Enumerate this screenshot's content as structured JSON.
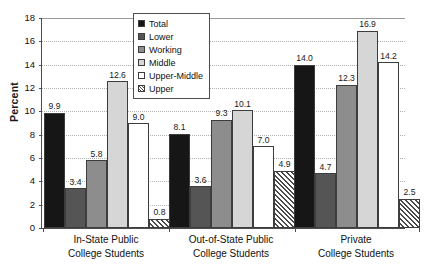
{
  "chart_data": {
    "type": "bar",
    "title": "",
    "xlabel": "",
    "ylabel": "Percent",
    "ylim": [
      0,
      18
    ],
    "ytick_values": [
      0,
      2,
      4,
      6,
      8,
      10,
      12,
      14,
      16,
      18
    ],
    "ytick_labels": [
      "0",
      "2",
      "4",
      "6",
      "8",
      "10",
      "12",
      "14",
      "16",
      "18"
    ],
    "grid": true,
    "legend_position": "top-center",
    "categories": [
      "In-State Public College Students",
      "Out-of-State Public College Students",
      "Private College Students"
    ],
    "category_lines": [
      [
        "In-State Public",
        "College Students"
      ],
      [
        "Out-of-State Public",
        "College Students"
      ],
      [
        "Private",
        "College Students"
      ]
    ],
    "series": [
      {
        "name": "Total",
        "key": "total",
        "swatch": "black",
        "color": "#161616",
        "values": [
          9.9,
          8.1,
          14.0
        ],
        "labels": [
          "9.9",
          "8.1",
          "14.0"
        ]
      },
      {
        "name": "Lower",
        "key": "lower",
        "swatch": "dark-gray",
        "color": "#555555",
        "values": [
          3.4,
          3.6,
          4.7
        ],
        "labels": [
          "3.4",
          "3.6",
          "4.7"
        ]
      },
      {
        "name": "Working",
        "key": "working",
        "swatch": "medium-gray",
        "color": "#8d8d8d",
        "values": [
          5.8,
          9.3,
          12.3
        ],
        "labels": [
          "5.8",
          "9.3",
          "12.3"
        ]
      },
      {
        "name": "Middle",
        "key": "middle",
        "swatch": "light-gray",
        "color": "#d6d6d6",
        "values": [
          12.6,
          10.1,
          16.9
        ],
        "labels": [
          "12.6",
          "10.1",
          "16.9"
        ]
      },
      {
        "name": "Upper-Middle",
        "key": "uppermid",
        "swatch": "white",
        "color": "#ffffff",
        "values": [
          9.0,
          7.0,
          14.2
        ],
        "labels": [
          "9.0",
          "7.0",
          "14.2"
        ]
      },
      {
        "name": "Upper",
        "key": "upper",
        "swatch": "diagonal-hatch",
        "color": "#ffffff",
        "values": [
          0.8,
          4.9,
          2.5
        ],
        "labels": [
          "0.8",
          "4.9",
          "2.5"
        ]
      }
    ]
  },
  "legend": {
    "items": [
      {
        "label": "Total"
      },
      {
        "label": "Lower"
      },
      {
        "label": "Working"
      },
      {
        "label": "Middle"
      },
      {
        "label": "Upper-Middle"
      },
      {
        "label": "Upper"
      }
    ]
  }
}
